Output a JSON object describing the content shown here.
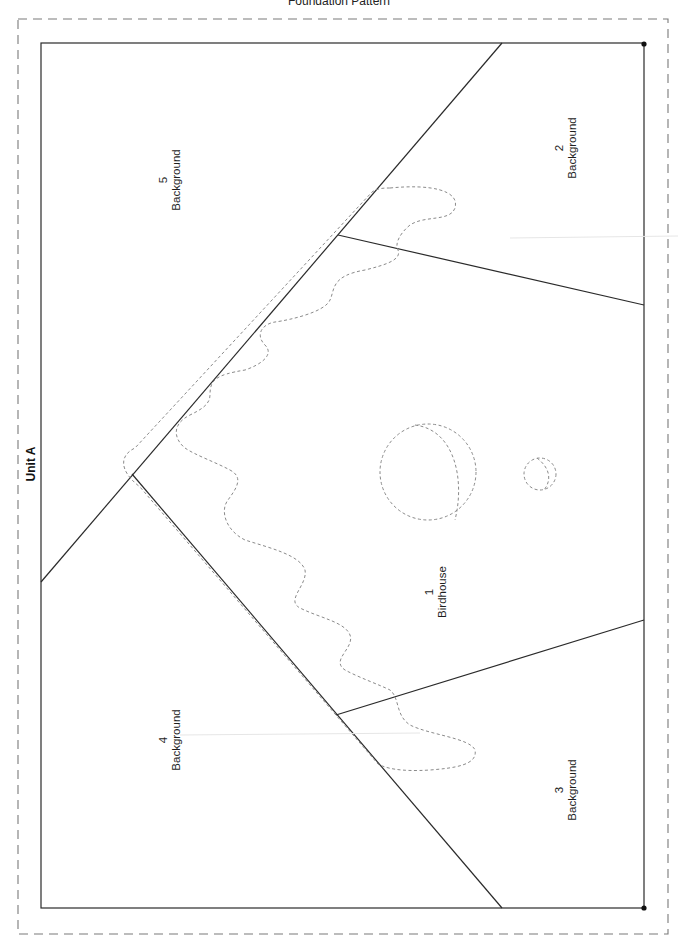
{
  "page": {
    "title": "Foundation Pattern",
    "unit_label": "Unit A"
  },
  "sections": [
    {
      "number": "1",
      "name": "Birdhouse",
      "x": 436,
      "y": 592
    },
    {
      "number": "2",
      "name": "Background",
      "x": 566,
      "y": 148
    },
    {
      "number": "3",
      "name": "Background",
      "x": 566,
      "y": 790
    },
    {
      "number": "4",
      "name": "Background",
      "x": 170,
      "y": 740
    },
    {
      "number": "5",
      "name": "Background",
      "x": 170,
      "y": 180
    }
  ],
  "colors": {
    "seam_line": "#2a2a2a",
    "cut_line": "#7a7a7a",
    "applique_line": "#8a8a8a",
    "background": "#ffffff"
  },
  "geometry": {
    "cut_border": {
      "x": 18,
      "y": 19,
      "w": 650,
      "h": 915
    },
    "sew_border": {
      "x": 41,
      "y": 43,
      "w": 603,
      "h": 865
    }
  }
}
